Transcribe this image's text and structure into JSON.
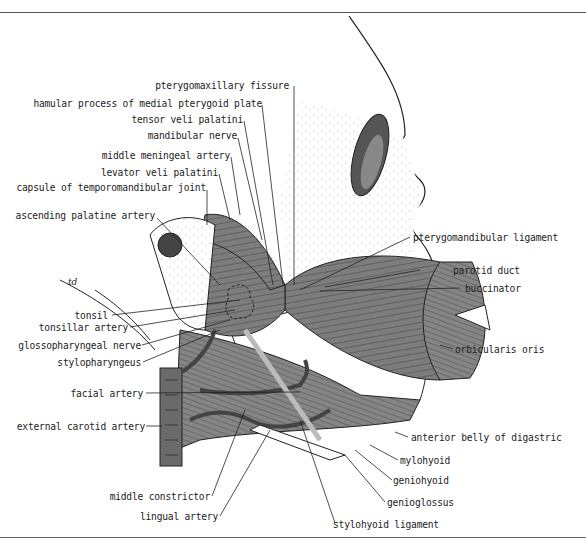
{
  "figure": {
    "illustrator_mark": "td",
    "labels_left": [
      {
        "id": "pterygomaxillary-fissure",
        "text": "pterygomaxillary fissure"
      },
      {
        "id": "hamular-process",
        "text": "hamular process of medial pterygoid plate"
      },
      {
        "id": "tensor-veli-palatini",
        "text": "tensor veli palatini"
      },
      {
        "id": "mandibular-nerve",
        "text": "mandibular nerve"
      },
      {
        "id": "middle-meningeal-artery",
        "text": "middle meningeal artery"
      },
      {
        "id": "levator-veli-palatini",
        "text": "levator veli palatini"
      },
      {
        "id": "capsule-tmj",
        "text": "capsule of temporomandibular joint"
      },
      {
        "id": "ascending-palatine-artery",
        "text": "ascending palatine artery"
      },
      {
        "id": "tonsil",
        "text": "tonsil"
      },
      {
        "id": "tonsillar-artery",
        "text": "tonsillar  artery"
      },
      {
        "id": "glossopharyngeal-nerve",
        "text": "glossopharyngeal nerve"
      },
      {
        "id": "stylopharyngeus",
        "text": "stylopharyngeus"
      },
      {
        "id": "facial-artery",
        "text": "facial artery"
      },
      {
        "id": "external-carotid-artery",
        "text": "external carotid artery"
      },
      {
        "id": "middle-constrictor",
        "text": "middle constrictor"
      },
      {
        "id": "lingual-artery",
        "text": "lingual artery"
      }
    ],
    "labels_right": [
      {
        "id": "pterygomandibular-ligament",
        "text": "pterygomandibular ligament"
      },
      {
        "id": "parotid-duct",
        "text": "parotid duct"
      },
      {
        "id": "buccinator",
        "text": "buccinator"
      },
      {
        "id": "orbicularis-oris",
        "text": "orbicularis oris"
      },
      {
        "id": "anterior-belly-digastric",
        "text": "anterior belly of digastric"
      },
      {
        "id": "mylohyoid",
        "text": "mylohyoid"
      },
      {
        "id": "geniohyoid",
        "text": "geniohyoid"
      },
      {
        "id": "genioglossus",
        "text": "genioglossus"
      },
      {
        "id": "stylohyoid-ligament",
        "text": "stylohyoid ligament"
      }
    ],
    "colors": {
      "muscle": "#7a7a7a",
      "muscle_dark": "#555555",
      "bone_stipple": "#9a9a9a",
      "line": "#222222"
    }
  }
}
